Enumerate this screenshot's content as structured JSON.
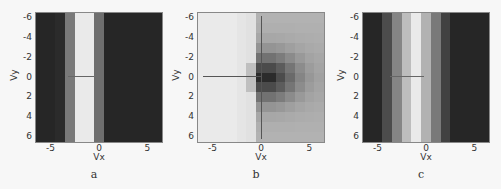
{
  "chart_data": [
    {
      "type": "heatmap",
      "panel": "a",
      "caption": "a",
      "xlabel": "Vx",
      "ylabel": "Vy",
      "xticks": [
        "-5",
        "0",
        "5"
      ],
      "yticks": [
        "-6",
        "-4",
        "-2",
        "0",
        "2",
        "4",
        "6"
      ],
      "xlim": [
        -6.5,
        6.5
      ],
      "ylim": [
        -6.5,
        6.5
      ],
      "description": "Vertical stripe pattern: bright column near Vx≈-2, flanked by gray columns, dark elsewhere",
      "column_intensity": [
        0.08,
        0.08,
        0.1,
        0.45,
        0.95,
        0.95,
        0.4,
        0.08,
        0.08,
        0.08,
        0.08,
        0.08,
        0.08
      ]
    },
    {
      "type": "heatmap",
      "panel": "b",
      "caption": "b",
      "xlabel": "Vx",
      "ylabel": "Vy",
      "xticks": [
        "-5",
        "0",
        "5"
      ],
      "yticks": [
        "-6",
        "-4",
        "-2",
        "0",
        "2",
        "4",
        "6"
      ],
      "xlim": [
        -6.5,
        6.5
      ],
      "ylim": [
        -6.5,
        6.5
      ],
      "description": "Light on left, darkening toward right; darkest block centered near (Vx≈0.5, Vy≈0), with crosshair lines at Vx=0 and Vy=0"
    },
    {
      "type": "heatmap",
      "panel": "c",
      "caption": "c",
      "xlabel": "Vx",
      "ylabel": "Vy",
      "xticks": [
        "-5",
        "0",
        "5"
      ],
      "yticks": [
        "-6",
        "-4",
        "-2",
        "0",
        "2",
        "4",
        "6"
      ],
      "xlim": [
        -6.5,
        6.5
      ],
      "ylim": [
        -6.5,
        6.5
      ],
      "description": "Wider graded vertical stripe centered near Vx≈-2, bright center fading to dark",
      "column_intensity": [
        0.08,
        0.08,
        0.25,
        0.5,
        0.75,
        0.95,
        0.7,
        0.45,
        0.2,
        0.08,
        0.08,
        0.08,
        0.08
      ]
    }
  ]
}
